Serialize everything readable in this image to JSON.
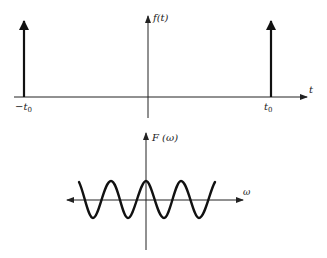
{
  "top_plot": {
    "ylabel": "f(t)",
    "xlabel": "t",
    "impulses": [
      {
        "label": "−t",
        "subscript": "0",
        "position": "-t0"
      },
      {
        "label": "t",
        "subscript": "0",
        "position": "t0"
      }
    ]
  },
  "bottom_plot": {
    "ylabel": "F (ω)",
    "xlabel": "ω",
    "curve": "cosine"
  },
  "colors": {
    "ink": "#222222",
    "background": "#ffffff"
  }
}
